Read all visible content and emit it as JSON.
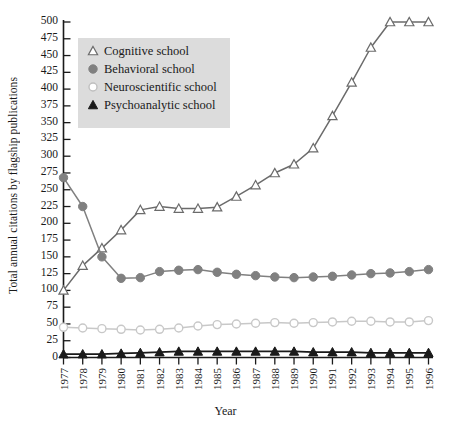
{
  "chart_data": {
    "type": "line",
    "title": "",
    "xlabel": "Year",
    "ylabel": "Total annual citations by flagship publications",
    "categories": [
      "1977",
      "1978",
      "1979",
      "1980",
      "1981",
      "1982",
      "1983",
      "1984",
      "1985",
      "1986",
      "1987",
      "1988",
      "1989",
      "1990",
      "1991",
      "1992",
      "1993",
      "1994",
      "1995",
      "1996"
    ],
    "x": [
      1977,
      1978,
      1979,
      1980,
      1981,
      1982,
      1983,
      1984,
      1985,
      1986,
      1987,
      1988,
      1989,
      1990,
      1991,
      1992,
      1993,
      1994,
      1995,
      1996
    ],
    "ylim": [
      0,
      510
    ],
    "xlim": [
      1976.6,
      1996.4
    ],
    "yticks": [
      0,
      25,
      50,
      75,
      100,
      125,
      150,
      175,
      200,
      225,
      250,
      275,
      300,
      325,
      350,
      375,
      400,
      425,
      450,
      475,
      500
    ],
    "grid": false,
    "legend_position": "upper-left",
    "series": [
      {
        "name": "Cognitive school",
        "marker": "triangle-up-open",
        "color": "#6b6b6b",
        "values": [
          100,
          137,
          163,
          190,
          220,
          225,
          222,
          222,
          224,
          240,
          257,
          275,
          288,
          312,
          360,
          410,
          462,
          500,
          500,
          500
        ]
      },
      {
        "name": "Behavioral school",
        "marker": "circle-filled",
        "color": "#808080",
        "values": [
          268,
          225,
          150,
          118,
          119,
          128,
          130,
          131,
          127,
          124,
          122,
          120,
          119,
          120,
          121,
          123,
          125,
          126,
          128,
          131
        ]
      },
      {
        "name": "Neuroscientific school",
        "marker": "circle-open",
        "color": "#c8c8c8",
        "values": [
          45,
          44,
          43,
          42,
          41,
          42,
          44,
          47,
          49,
          50,
          51,
          52,
          51,
          52,
          53,
          54,
          54,
          53,
          53,
          55
        ]
      },
      {
        "name": "Psychoanalytic school",
        "marker": "triangle-up-filled",
        "color": "#1a1a1a",
        "values": [
          5,
          5,
          5,
          6,
          7,
          8,
          9,
          9,
          9,
          9,
          9,
          9,
          9,
          8,
          8,
          8,
          7,
          7,
          7,
          7
        ]
      }
    ]
  },
  "legend": {
    "items": [
      {
        "label": "Cognitive school",
        "marker": "triangle-up-open",
        "color": "#6b6b6b"
      },
      {
        "label": "Behavioral school",
        "marker": "circle-filled",
        "color": "#808080"
      },
      {
        "label": "Neuroscientific school",
        "marker": "circle-open",
        "color": "#d8d8d8"
      },
      {
        "label": "Psychoanalytic school",
        "marker": "triangle-up-filled",
        "color": "#1a1a1a"
      }
    ],
    "background": "#dcdcdc"
  },
  "axes": {
    "y_title": "Total annual citations by flagship publications",
    "x_title": "Year"
  }
}
